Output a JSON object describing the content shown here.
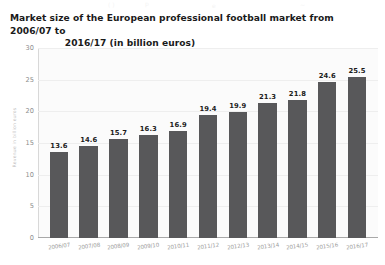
{
  "title": {
    "line1": "Market size of the European professional football market from 2006/07 to",
    "line2": "2016/17 (in billion euros)"
  },
  "artifacts": {
    "a1": "( )",
    "a2": "p",
    "a3": "e",
    "a4": "~"
  },
  "chart_data": {
    "type": "bar",
    "title": "Market size of the European professional football market from 2006/07 to 2016/17 (in billion euros)",
    "xlabel": "",
    "ylabel": "Revenue in billion euros",
    "categories": [
      "2006/07",
      "2007/08",
      "2008/09",
      "2009/10",
      "2010/11",
      "2011/12",
      "2012/13",
      "2013/14",
      "2014/15",
      "2015/16",
      "2016/17"
    ],
    "values": [
      13.6,
      14.6,
      15.7,
      16.3,
      16.9,
      19.4,
      19.9,
      21.3,
      21.8,
      24.6,
      25.5
    ],
    "value_labels": [
      "13.6",
      "14.6",
      "15.7",
      "16.3",
      "16.9",
      "19.4",
      "19.9",
      "21.3",
      "21.8",
      "24.6",
      "25.5"
    ],
    "ylim": [
      0,
      30
    ],
    "yticks": [
      0,
      5,
      10,
      15,
      20,
      25,
      30
    ],
    "ytick_labels": [
      "0",
      "5",
      "10",
      "15",
      "20",
      "25",
      "30"
    ],
    "grid": true,
    "legend": false,
    "bar_color": "#58585a",
    "plot_background": "#fbfbfb",
    "axis_color": "#a8a8a8",
    "gridline_color": "#eeeeee",
    "tick_label_color": "#8d8d8d"
  }
}
